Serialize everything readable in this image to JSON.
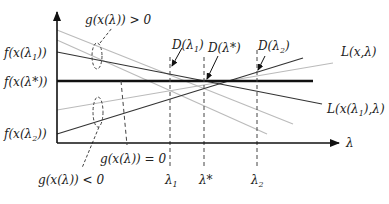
{
  "diagram": {
    "colors": {
      "dark": "#333333",
      "light": "#bbbbbb",
      "thick": "#111111",
      "dash": "#444444"
    },
    "y_labels": {
      "f_lambda1": {
        "pre": "f(x(λ",
        "sub": "1",
        "post": "))"
      },
      "f_lambda_star": {
        "text": "f(x(λ*))"
      },
      "f_lambda2": {
        "pre": "f(x(λ",
        "sub": "2",
        "post": "))"
      }
    },
    "x_axis_label": "λ",
    "x_ticks": {
      "lambda1": {
        "pre": "λ",
        "sub": "1"
      },
      "lambda_star": {
        "text": "λ*"
      },
      "lambda2": {
        "pre": "λ",
        "sub": "2"
      }
    },
    "annotations": {
      "g_positive": "g(x(λ)) > 0",
      "g_zero": "g(x(λ)) = 0",
      "g_negative": "g(x(λ)) < 0",
      "D_lambda1": {
        "pre": "D(λ",
        "sub": "1",
        "post": ")"
      },
      "D_lambda_star": {
        "text": "D(λ*)"
      },
      "D_lambda2": {
        "pre": "D(λ",
        "sub": "2",
        "post": ")"
      },
      "L_x_lambda": "L(x,λ)",
      "L_x_lambda1": {
        "pre": "L(x(λ",
        "sub": "1",
        "post": "),λ)"
      }
    }
  }
}
